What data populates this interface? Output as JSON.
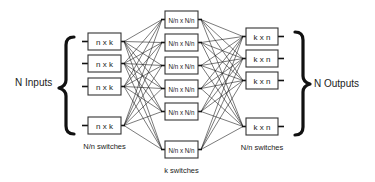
{
  "diagram": {
    "type": "three-stage Clos switching network",
    "left_group": {
      "label": "N Inputs",
      "caption": "N/n switches",
      "switch_label": "n x k",
      "boxes": [
        {
          "x": 88,
          "y": 33
        },
        {
          "x": 88,
          "y": 55
        },
        {
          "x": 88,
          "y": 78
        },
        {
          "x": 88,
          "y": 117
        }
      ]
    },
    "middle_group": {
      "caption": "k switches",
      "switch_label": "N/n x N/n",
      "boxes": [
        {
          "x": 165,
          "y": 11
        },
        {
          "x": 165,
          "y": 34
        },
        {
          "x": 165,
          "y": 57
        },
        {
          "x": 165,
          "y": 80
        },
        {
          "x": 165,
          "y": 103
        },
        {
          "x": 165,
          "y": 141
        }
      ]
    },
    "right_group": {
      "label": "N Outputs",
      "caption": "N/n switches",
      "switch_label": "k x n",
      "boxes": [
        {
          "x": 246,
          "y": 28
        },
        {
          "x": 246,
          "y": 50
        },
        {
          "x": 246,
          "y": 72
        },
        {
          "x": 246,
          "y": 118
        }
      ]
    },
    "box_size": {
      "left_w": 33,
      "mid_w": 33,
      "right_w": 32,
      "h": 17
    },
    "colors": {
      "line": "#222222",
      "box_fill": "#ffffff",
      "text": "#222222"
    }
  }
}
